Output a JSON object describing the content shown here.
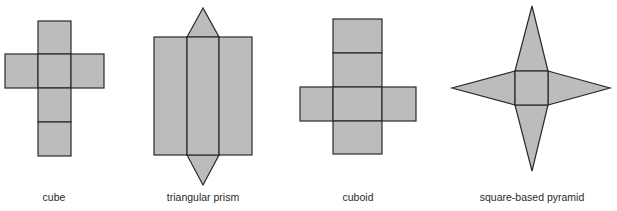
{
  "diagram": {
    "fill_color": "#bcbcbc",
    "stroke_color": "#2a2a2a",
    "nets": [
      {
        "name": "cube",
        "label": "cube"
      },
      {
        "name": "triangular-prism",
        "label": "triangular prism"
      },
      {
        "name": "cuboid",
        "label": "cuboid"
      },
      {
        "name": "square-based-pyramid",
        "label": "square-based pyramid"
      }
    ]
  }
}
